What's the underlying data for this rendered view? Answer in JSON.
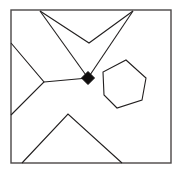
{
  "canvas": {
    "width": 181,
    "height": 173,
    "background": "#ffffff",
    "title": "geometric-line-diagram"
  },
  "style": {
    "line_color": "#221f1f",
    "line_width": 1.1,
    "frame_color": "#4a4747",
    "frame_width": 1.4,
    "node_color": "#100e0e",
    "fill_color": "#ffffff"
  },
  "frame": {
    "label": "bounding-square",
    "x": 11,
    "y": 10,
    "width": 160,
    "height": 153
  },
  "node": {
    "label": "junction-node",
    "shape": "diamond",
    "cx": 88,
    "cy": 78,
    "radius": 6.5,
    "color": "#100e0e"
  },
  "shapes": [
    {
      "id": "left-chevron",
      "label": "left-chevron-polyline",
      "closed": false,
      "points": "11,43 44,82 11,115"
    },
    {
      "id": "top-left-spoke",
      "label": "top-left-spoke-line",
      "closed": false,
      "points": "40,11 88,78"
    },
    {
      "id": "top-vee",
      "label": "top-vee-polyline",
      "closed": false,
      "points": "40,11 89,43 133,11"
    },
    {
      "id": "top-right-spoke",
      "label": "top-right-spoke-line",
      "closed": false,
      "points": "88,78 133,11"
    },
    {
      "id": "left-spoke",
      "label": "left-spoke-line",
      "closed": false,
      "points": "44,82 88,78"
    },
    {
      "id": "bottom-triangle",
      "label": "bottom-triangle-polyline",
      "closed": false,
      "points": "22,163 68,114 122,163"
    },
    {
      "id": "hexagon",
      "label": "hexagon-polygon",
      "closed": true,
      "points": "126,60 146,78 142,100 117,108 104,95 103,72"
    }
  ]
}
